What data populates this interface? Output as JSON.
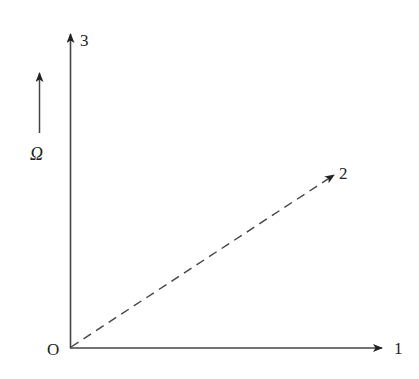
{
  "diagram": {
    "origin_label": "O",
    "axes": [
      {
        "id": "axis-1",
        "label": "1",
        "style": "solid",
        "direction": "horizontal"
      },
      {
        "id": "axis-2",
        "label": "2",
        "style": "dashed",
        "direction": "diagonal"
      },
      {
        "id": "axis-3",
        "label": "3",
        "style": "solid",
        "direction": "vertical"
      }
    ],
    "rotation": {
      "label": "Ω",
      "direction": "up"
    },
    "colors": {
      "line": "#333333",
      "background": "#ffffff"
    }
  }
}
